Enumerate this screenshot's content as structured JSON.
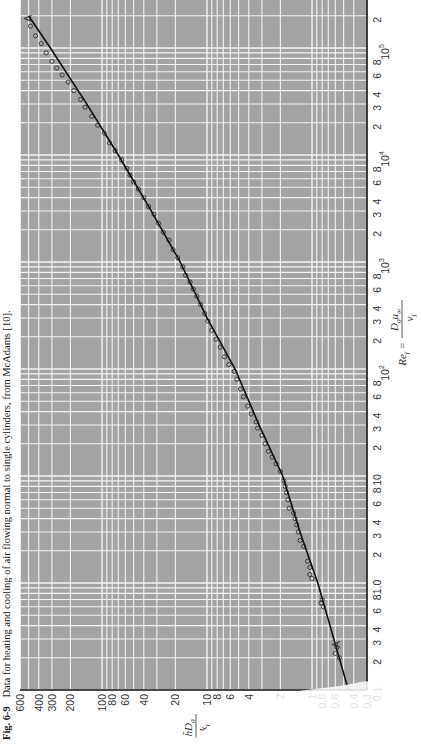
{
  "caption": {
    "fig_label": "Fig. 6-9",
    "text": "Data for heating and cooling of air flowing normal to single cylinders, from McAdams [10]."
  },
  "chart_data": {
    "type": "scatter",
    "title": "Data for heating and cooling of air flowing normal to single cylinders, from McAdams [10].",
    "xlabel": "Re_f = D_0 u_inf / nu_f",
    "ylabel": "h D_0 / k_f",
    "xscale": "log",
    "yscale": "log",
    "xlim": [
      0.1,
      200000
    ],
    "ylim": [
      0.3,
      600
    ],
    "grid": true,
    "orientation": "rotated 90deg counterclockwise on page",
    "x_ticks": [
      "0.1",
      "2",
      "3",
      "4",
      "6",
      "8",
      "1.0",
      "2",
      "3",
      "4",
      "6",
      "8",
      "10",
      "2",
      "3",
      "4",
      "6",
      "8",
      "10^2",
      "2",
      "3",
      "4",
      "6",
      "8",
      "10^3",
      "2",
      "3",
      "4",
      "6",
      "8",
      "10^4",
      "2",
      "3",
      "4",
      "6",
      "8",
      "10^5",
      "2"
    ],
    "y_ticks": [
      "0.3",
      "0.4",
      "0.6",
      "0.8",
      "1",
      "2",
      "4",
      "6",
      "8",
      "10",
      "20",
      "40",
      "60",
      "80",
      "100",
      "200",
      "300",
      "400",
      "600"
    ],
    "annotations": [
      "A (lower end of correlation line)",
      "A (upper end of correlation line)"
    ],
    "series": [
      {
        "name": "Correlation curve A-A",
        "type": "line",
        "x": [
          0.1,
          0.3,
          1,
          3,
          10,
          30,
          100,
          300,
          1000,
          3000,
          10000,
          30000,
          100000,
          200000
        ],
        "y": [
          0.45,
          0.62,
          0.88,
          1.3,
          1.9,
          3.2,
          5.4,
          10,
          18,
          34,
          70,
          140,
          310,
          500
        ]
      },
      {
        "name": "Experimental data (McAdams)",
        "type": "scatter",
        "x": [
          0.2,
          0.22,
          0.25,
          0.6,
          0.65,
          0.7,
          1.1,
          1.2,
          1.4,
          1.6,
          2.2,
          2.5,
          3,
          3.5,
          4,
          4.5,
          5,
          6,
          7,
          8,
          9,
          11,
          13,
          15,
          17,
          20,
          24,
          28,
          32,
          38,
          45,
          55,
          65,
          80,
          95,
          110,
          130,
          160,
          190,
          230,
          280,
          330,
          400,
          480,
          560,
          650,
          750,
          900,
          1100,
          1300,
          1600,
          1900,
          2300,
          2800,
          3300,
          4000,
          4800,
          5600,
          6500,
          7500,
          9000,
          11000,
          13000,
          16000,
          19000,
          23000,
          28000,
          33000,
          40000,
          48000,
          56000,
          65000,
          75000,
          90000,
          110000,
          130000,
          160000
        ],
        "y": [
          0.55,
          0.6,
          0.58,
          0.78,
          0.82,
          0.8,
          1.0,
          1.05,
          1.05,
          1.1,
          1.2,
          1.3,
          1.35,
          1.4,
          1.45,
          1.5,
          1.65,
          1.7,
          1.75,
          1.8,
          1.85,
          2.0,
          2.2,
          2.4,
          2.6,
          2.8,
          3.0,
          3.3,
          3.4,
          3.8,
          4.1,
          4.5,
          4.8,
          5.2,
          5.5,
          6.2,
          6.8,
          7.5,
          8.2,
          9.0,
          9.8,
          10.5,
          11.5,
          12.5,
          13.5,
          14.5,
          16,
          17,
          19,
          21,
          23,
          26,
          29,
          32,
          36,
          40,
          45,
          50,
          54,
          58,
          65,
          75,
          85,
          95,
          110,
          125,
          145,
          160,
          185,
          210,
          240,
          270,
          300,
          340,
          380,
          430,
          480
        ]
      }
    ]
  },
  "axes": {
    "nu_label_num": "h̄D",
    "nu_label_sub": "0",
    "nu_label_den": "k",
    "nu_label_den_sub": "f",
    "re_label_lhs": "Re",
    "re_label_lhs_sub": "f",
    "re_label_num": "D",
    "re_label_num_sub": "0",
    "re_label_num_u": "u",
    "re_label_num_u_sub": "∞",
    "re_label_den": "ν",
    "re_label_den_sub": "f",
    "curve_label_low": "A",
    "curve_label_high": "A"
  },
  "colors": {
    "plot_bg": "#a3a3a3",
    "grid": "#f4f4f4",
    "line": "#111111",
    "marker_edge": "#222222"
  }
}
